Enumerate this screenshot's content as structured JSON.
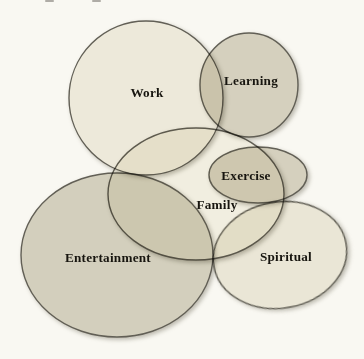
{
  "figure": {
    "width": 364,
    "height": 359,
    "background": "#f9f8f2",
    "stroke_color": "#64625a",
    "stroke_width": 1.4,
    "label_color": "#17150f",
    "artifact_color": "#95938c",
    "shapes": [
      {
        "id": "work",
        "label": "Work",
        "cx": 146,
        "cy": 98,
        "rx": 77,
        "ry": 77,
        "rotate": 0,
        "fill": "#f3f0e6",
        "label_x": 147,
        "label_y": 92
      },
      {
        "id": "learning",
        "label": "Learning",
        "cx": 249,
        "cy": 85,
        "rx": 49,
        "ry": 52,
        "rotate": 0,
        "fill": "#dad6c8",
        "label_x": 251,
        "label_y": 80
      },
      {
        "id": "family",
        "label": "Family",
        "cx": 196,
        "cy": 194,
        "rx": 88,
        "ry": 66,
        "rotate": 0,
        "fill": "#f7f5ec",
        "label_x": 217,
        "label_y": 204
      },
      {
        "id": "exercise",
        "label": "Exercise",
        "cx": 258,
        "cy": 175,
        "rx": 49,
        "ry": 28,
        "rotate": 0,
        "fill": "#dad6c8",
        "label_x": 246,
        "label_y": 175
      },
      {
        "id": "entertainment",
        "label": "Entertainment",
        "cx": 117,
        "cy": 255,
        "rx": 96,
        "ry": 82,
        "rotate": 0,
        "fill": "#d8d5c7",
        "label_x": 108,
        "label_y": 257
      },
      {
        "id": "spiritual",
        "label": "Spiritual",
        "cx": 280,
        "cy": 255,
        "rx": 67,
        "ry": 53,
        "rotate": -10,
        "fill": "#f0ede2",
        "label_x": 286,
        "label_y": 256
      }
    ],
    "artifacts": [
      {
        "x": 45,
        "y": 0,
        "w": 9,
        "h": 2
      },
      {
        "x": 92,
        "y": 0,
        "w": 9,
        "h": 2
      }
    ]
  }
}
